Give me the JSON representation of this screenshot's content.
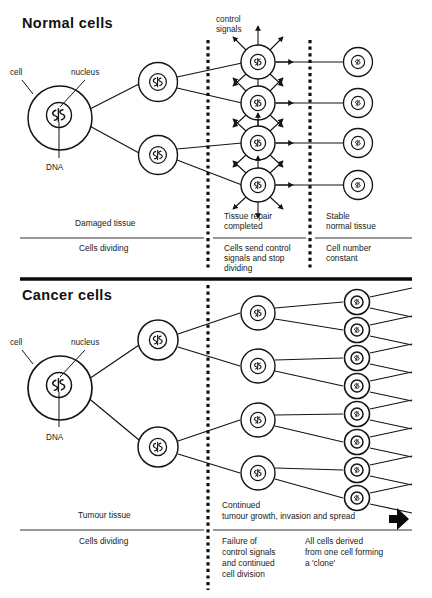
{
  "figure": {
    "title_normal": "Normal cells",
    "title_cancer": "Cancer cells",
    "background_color": "#ffffff",
    "ink_color": "#141414"
  },
  "normal_panel": {
    "heading": "Normal cells",
    "annotations": {
      "cell": "cell",
      "nucleus": "nucleus",
      "dna": "DNA",
      "control_signals_line1": "control",
      "control_signals_line2": "signals"
    },
    "stage_labels_upper": [
      {
        "id": "damaged-tissue",
        "lines": [
          "Damaged tissue"
        ]
      },
      {
        "id": "tissue-repair",
        "lines": [
          "Tissue repair",
          "completed"
        ]
      },
      {
        "id": "stable-normal-tissue",
        "lines": [
          "Stable",
          "normal tissue"
        ]
      }
    ],
    "stage_labels_lower": [
      {
        "id": "cells-dividing",
        "lines": [
          "Cells dividing"
        ]
      },
      {
        "id": "cells-send-control-signals",
        "lines": [
          "Cells send control",
          "signals and stop",
          "dividing"
        ]
      },
      {
        "id": "cell-number-constant",
        "lines": [
          "Cell number",
          "constant"
        ]
      }
    ],
    "cell_counts": {
      "generation_1": 1,
      "generation_2": 2,
      "generation_3": 4,
      "generation_4": 4
    }
  },
  "cancer_panel": {
    "heading": "Cancer cells",
    "annotations": {
      "cell": "cell",
      "nucleus": "nucleus",
      "dna": "DNA"
    },
    "stage_labels_upper": [
      {
        "id": "tumour-tissue",
        "lines": [
          "Tumour tissue"
        ]
      },
      {
        "id": "continued-growth",
        "lines": [
          "Continued",
          "tumour growth, invasion and spread"
        ]
      }
    ],
    "stage_labels_lower": [
      {
        "id": "cells-dividing",
        "lines": [
          "Cells dividing"
        ]
      },
      {
        "id": "failure-of-control-signals",
        "lines": [
          "Failure of",
          "control signals",
          "and continued",
          "cell division"
        ]
      },
      {
        "id": "all-cells-derived",
        "lines": [
          "All cells derived",
          "from one cell forming",
          "a 'clone'"
        ]
      }
    ],
    "cell_counts": {
      "generation_1": 1,
      "generation_2": 2,
      "generation_3": 4,
      "generation_4": 8
    },
    "spread_arrow": "solid-right-arrow"
  }
}
